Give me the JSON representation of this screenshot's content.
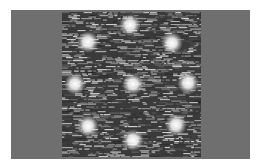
{
  "image": {
    "description": "Grayscale scanning-probe style micrograph showing a hexagonal ring of bright spots around a central spot on a noisy dark background",
    "colors": {
      "border": "#ffffff",
      "panel": "#6f6f6f",
      "scan_bg": "#3a3a3a",
      "spot": "#ffffff"
    },
    "spots": [
      {
        "x": 68,
        "y": 13
      },
      {
        "x": 26,
        "y": 30
      },
      {
        "x": 110,
        "y": 31
      },
      {
        "x": 13,
        "y": 72
      },
      {
        "x": 71,
        "y": 72
      },
      {
        "x": 126,
        "y": 71
      },
      {
        "x": 26,
        "y": 114
      },
      {
        "x": 71,
        "y": 128
      },
      {
        "x": 114,
        "y": 113
      }
    ]
  }
}
